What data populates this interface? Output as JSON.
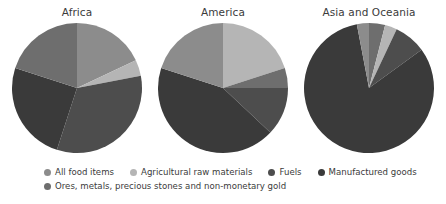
{
  "chart_data": {
    "type": "pie",
    "title": "",
    "legend_position": "bottom",
    "grid": false,
    "categories": [
      "All food items",
      "Agricultural raw materials",
      "Fuels",
      "Manufactured goods",
      "Ores, metals, precious stones and non-monetary gold"
    ],
    "colors": {
      "all_food_items": "#8c8c8c",
      "agricultural_raw_materials": "#b5b5b5",
      "fuels": "#4d4d4d",
      "manufactured_goods": "#3a3a3a",
      "ores_metals": "#6e6e6e"
    },
    "charts": [
      {
        "title": "Africa",
        "slices": [
          {
            "label": "All food items",
            "value": 18,
            "color": "#8c8c8c"
          },
          {
            "label": "Agricultural raw materials",
            "value": 4,
            "color": "#b5b5b5"
          },
          {
            "label": "Fuels",
            "value": 33,
            "color": "#4d4d4d"
          },
          {
            "label": "Manufactured goods",
            "value": 25,
            "color": "#3a3a3a"
          },
          {
            "label": "Ores, metals, precious stones and non-monetary gold",
            "value": 20,
            "color": "#6e6e6e"
          }
        ]
      },
      {
        "title": "America",
        "slices": [
          {
            "label": "Agricultural raw materials",
            "value": 20,
            "color": "#b5b5b5"
          },
          {
            "label": "Ores, metals, precious stones and non-monetary gold",
            "value": 5,
            "color": "#6e6e6e"
          },
          {
            "label": "Fuels",
            "value": 12,
            "color": "#4d4d4d"
          },
          {
            "label": "Manufactured goods",
            "value": 43,
            "color": "#3a3a3a"
          },
          {
            "label": "All food items",
            "value": 20,
            "color": "#8c8c8c"
          }
        ]
      },
      {
        "title": "Asia and Oceania",
        "slices": [
          {
            "label": "Ores, metals, precious stones and non-monetary gold",
            "value": 4,
            "color": "#6e6e6e"
          },
          {
            "label": "Agricultural raw materials",
            "value": 3,
            "color": "#b5b5b5"
          },
          {
            "label": "Fuels",
            "value": 8,
            "color": "#4d4d4d"
          },
          {
            "label": "Manufactured goods",
            "value": 82,
            "color": "#3a3a3a"
          },
          {
            "label": "All food items",
            "value": 3,
            "color": "#8c8c8c"
          }
        ]
      }
    ]
  },
  "panels": [
    {
      "title": "Africa"
    },
    {
      "title": "America"
    },
    {
      "title": "Asia and Oceania"
    }
  ],
  "legend": {
    "row1": [
      {
        "label": "All food items",
        "color": "#8c8c8c"
      },
      {
        "label": "Agricultural raw materials",
        "color": "#b5b5b5"
      },
      {
        "label": "Fuels",
        "color": "#4d4d4d"
      },
      {
        "label": "Manufactured goods",
        "color": "#3a3a3a"
      }
    ],
    "row2": [
      {
        "label": "Ores, metals, precious stones and non-monetary gold",
        "color": "#6e6e6e"
      }
    ]
  }
}
